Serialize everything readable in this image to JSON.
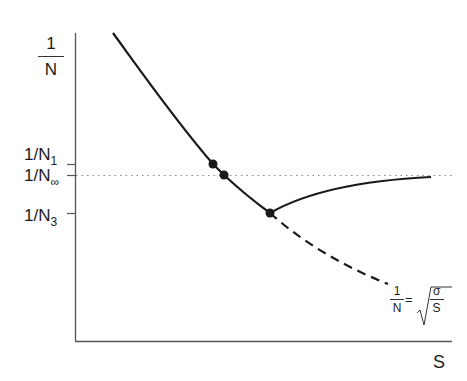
{
  "diagram": {
    "y_axis_label": {
      "numerator": "1",
      "denominator": "N"
    },
    "x_axis_label": "S",
    "y_ticks": [
      {
        "label": "1/N",
        "sub": "1"
      },
      {
        "label": "1/N",
        "sub": "∞"
      },
      {
        "label": "1/N",
        "sub": "3"
      }
    ],
    "asymptote_formula": {
      "lhs_numerator": "1",
      "lhs_denominator": "N",
      "equals": "=",
      "rhs_numerator": "σ",
      "rhs_denominator": "S"
    },
    "points": [
      {
        "name": "N1-point",
        "x": 213,
        "y": 164
      },
      {
        "name": "Ninf-point",
        "x": 224,
        "y": 175
      },
      {
        "name": "N3-point",
        "x": 270,
        "y": 213
      }
    ],
    "colors": {
      "line": "#1a1a1a",
      "axis": "#555555",
      "dotted": "#888888"
    }
  }
}
